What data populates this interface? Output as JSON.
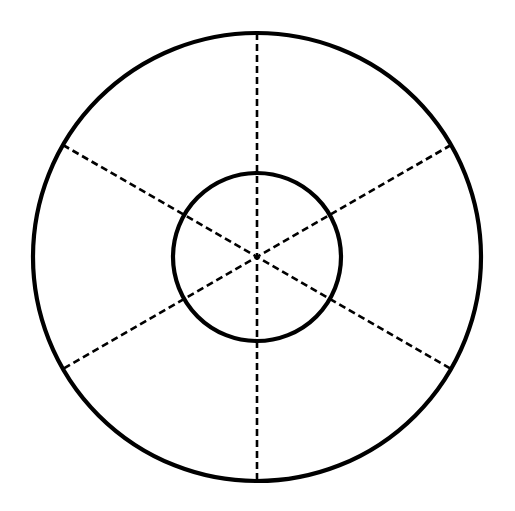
{
  "page": {
    "background_color": "#ffffff",
    "width": 515,
    "height": 511
  },
  "chart_data": {
    "type": "diagram",
    "title": "",
    "subtitle": "",
    "xlabel": "",
    "ylabel": "",
    "legend": [],
    "annotations": [],
    "grid": false,
    "center": {
      "x": 257,
      "y": 257
    },
    "shapes": [
      {
        "id": "outer-circle",
        "kind": "circle",
        "cx": 257,
        "cy": 257,
        "r": 224,
        "stroke": "#000000",
        "stroke_width": 4.2,
        "fill": "none",
        "dash": "solid"
      },
      {
        "id": "inner-circle",
        "kind": "circle",
        "cx": 257,
        "cy": 257,
        "r": 84,
        "stroke": "#000000",
        "stroke_width": 4.2,
        "fill": "none",
        "dash": "solid"
      }
    ],
    "diameters": [
      {
        "id": "vertical-diameter",
        "angle_deg": 90,
        "x1": 257,
        "y1": 33,
        "x2": 257,
        "y2": 481,
        "stroke": "#000000",
        "stroke_width": 2.6,
        "dash": "7 4"
      },
      {
        "id": "diameter-30-deg",
        "angle_deg": 30,
        "x1": 451,
        "y1": 145,
        "x2": 63,
        "y2": 369,
        "stroke": "#000000",
        "stroke_width": 2.6,
        "dash": "7 4"
      },
      {
        "id": "diameter-150-deg",
        "angle_deg": 150,
        "x1": 63,
        "y1": 145,
        "x2": 451,
        "y2": 369,
        "stroke": "#000000",
        "stroke_width": 2.6,
        "dash": "7 4"
      }
    ],
    "sector_count": 6,
    "sector_angle_deg": 60
  }
}
